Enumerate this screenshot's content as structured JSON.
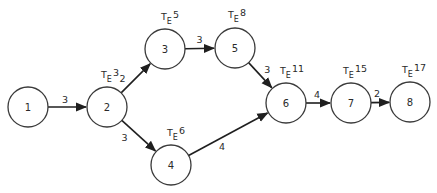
{
  "diagram": {
    "te_symbol": "T",
    "te_subscript": "E",
    "nodes": [
      {
        "id": "1",
        "label": "1",
        "te": null
      },
      {
        "id": "2",
        "label": "2",
        "te": "3"
      },
      {
        "id": "3",
        "label": "3",
        "te": "5"
      },
      {
        "id": "4",
        "label": "4",
        "te": "6"
      },
      {
        "id": "5",
        "label": "5",
        "te": "8"
      },
      {
        "id": "6",
        "label": "6",
        "te": "11"
      },
      {
        "id": "7",
        "label": "7",
        "te": "15"
      },
      {
        "id": "8",
        "label": "8",
        "te": "17"
      }
    ],
    "edges": [
      {
        "from": "1",
        "to": "2",
        "duration": "3"
      },
      {
        "from": "2",
        "to": "3",
        "duration": "2"
      },
      {
        "from": "2",
        "to": "4",
        "duration": "3"
      },
      {
        "from": "3",
        "to": "5",
        "duration": "3"
      },
      {
        "from": "5",
        "to": "6",
        "duration": "3"
      },
      {
        "from": "4",
        "to": "6",
        "duration": "4"
      },
      {
        "from": "6",
        "to": "7",
        "duration": "4"
      },
      {
        "from": "7",
        "to": "8",
        "duration": "2"
      }
    ],
    "colors": {
      "stroke": "#1f1f1f",
      "text": "#2a2a2a",
      "background": "#ffffff"
    }
  }
}
